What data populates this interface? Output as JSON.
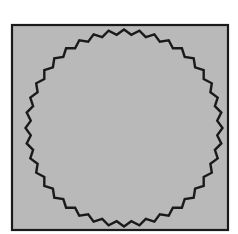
{
  "figure": {
    "colors": {
      "background": "#ffffff",
      "square_fill": "#b9b9b9",
      "stroke": "#1a1a1a"
    },
    "square": {
      "x": 12,
      "y": 25,
      "width": 216,
      "height": 205
    },
    "circle": {
      "cx": 124,
      "cy": 128,
      "r": 96,
      "teeth": 40,
      "jag": 5
    }
  }
}
